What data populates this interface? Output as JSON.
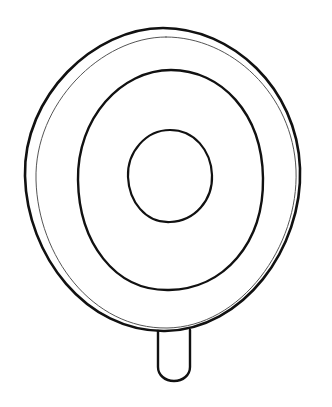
{
  "artwork": {
    "title": "Concentric Circles Object With Handle Tab",
    "subject": "pan-lid-top-view",
    "style": "hand-drawn line art",
    "background_color": "#ffffff",
    "stroke_color": "#1a1a1a",
    "canvas": {
      "width": 332,
      "height": 407
    }
  },
  "shapes": {
    "outer_ring": {
      "name": "outer-rim",
      "stroke_color": "#111111",
      "stroke_width": 2.6,
      "center_x": 163,
      "center_y": 180,
      "radius_x": 138,
      "radius_y": 152,
      "bounds": {
        "left": 25,
        "top": 28,
        "right": 301,
        "bottom": 332
      },
      "path": "M 163 28 C 232 28 297 88 300 168 C 303 248 243 330 165 331 C 86 332 27 256 25 176 C 23 96 94 28 163 28 Z"
    },
    "inner_offset_ring": {
      "name": "rim-highlight-line",
      "stroke_color": "#555555",
      "stroke_width": 1.0,
      "center_x": 166,
      "center_y": 183,
      "radius_x": 131,
      "radius_y": 146,
      "bounds": {
        "left": 35,
        "top": 37,
        "right": 297,
        "bottom": 329
      },
      "path": "M 166 37 C 231 37 293 94 296 170 C 299 246 241 327 167 328 C 92 329 38 256 36 180 C 34 104 101 37 166 37 Z"
    },
    "middle_ring": {
      "name": "middle-ring",
      "stroke_color": "#111111",
      "stroke_width": 2.4,
      "center_x": 171,
      "center_y": 180,
      "radius_x": 93,
      "radius_y": 110,
      "bounds": {
        "left": 78,
        "top": 70,
        "right": 264,
        "bottom": 290
      },
      "path": "M 171 70 C 221 70 262 113 263 178 C 264 243 224 289 169 290 C 114 291 79 242 78 180 C 77 118 121 70 171 70 Z"
    },
    "inner_circle": {
      "name": "inner-circle",
      "stroke_color": "#111111",
      "stroke_width": 2.2,
      "center_x": 170,
      "center_y": 176,
      "radius_x": 42,
      "radius_y": 46,
      "bounds": {
        "left": 128,
        "top": 130,
        "right": 212,
        "bottom": 222
      },
      "path": "M 170 130 C 194 130 211 150 212 175 C 213 200 195 221 170 222 C 145 223 129 201 128 177 C 127 152 146 130 170 130 Z"
    },
    "handle_tab": {
      "name": "handle-tab",
      "stroke_color": "#111111",
      "stroke_width": 2.4,
      "bounds": {
        "left": 158,
        "top": 330,
        "right": 190,
        "bottom": 381
      },
      "corner_radius": 14,
      "path": "M 158 331 L 158 367 C 158 375 165 381 174 381 C 183 381 190 375 190 367 L 190 330"
    }
  },
  "layers": [
    {
      "id": "outer_ring",
      "label": "Outer rim"
    },
    {
      "id": "inner_offset_ring",
      "label": "Rim highlight"
    },
    {
      "id": "middle_ring",
      "label": "Middle ring"
    },
    {
      "id": "inner_circle",
      "label": "Inner circle"
    },
    {
      "id": "handle_tab",
      "label": "Handle tab"
    }
  ]
}
